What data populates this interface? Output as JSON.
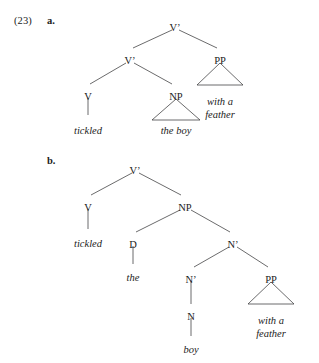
{
  "example": {
    "number": "(23)",
    "sub_a": "a.",
    "sub_b": "b."
  },
  "colors": {
    "stroke": "#39393b",
    "text": "#1b1b1b",
    "background": "#ffffff"
  },
  "trees": [
    {
      "id": "tree-a",
      "label": "a.",
      "sentence": "tickled the boy with a feather",
      "reading": "PP attaches to V-bar (adjunct of the verb phrase)",
      "nodes": [
        {
          "name": "v-bar-root",
          "text": "V’",
          "x": 175,
          "y": 22,
          "italic": false,
          "lines": 1
        },
        {
          "name": "v-bar-lower",
          "text": "V’",
          "x": 130,
          "y": 55,
          "italic": false,
          "lines": 1
        },
        {
          "name": "pp-node",
          "text": "PP",
          "x": 220,
          "y": 55,
          "italic": false,
          "lines": 1
        },
        {
          "name": "v-node",
          "text": "V",
          "x": 88,
          "y": 91,
          "italic": false,
          "lines": 1
        },
        {
          "name": "np-node",
          "text": "NP",
          "x": 176,
          "y": 91,
          "italic": false,
          "lines": 1
        },
        {
          "name": "terminal-tickled",
          "text": "tickled",
          "x": 88,
          "y": 125,
          "italic": true,
          "lines": 1
        },
        {
          "name": "terminal-the-boy",
          "text": "the boy",
          "x": 176,
          "y": 125,
          "italic": true,
          "lines": 1
        },
        {
          "name": "terminal-with-a-feather",
          "text": "with a\nfeather",
          "x": 220,
          "y": 96,
          "italic": true,
          "lines": 2
        }
      ],
      "branches": [
        {
          "name": "branch-root-to-vbar",
          "x1": 172,
          "y1": 30,
          "x2": 133,
          "y2": 48
        },
        {
          "name": "branch-root-to-pp",
          "x1": 179,
          "y1": 30,
          "x2": 217,
          "y2": 48
        },
        {
          "name": "branch-vbar-to-v",
          "x1": 126,
          "y1": 63,
          "x2": 90,
          "y2": 84
        },
        {
          "name": "branch-vbar-to-np",
          "x1": 134,
          "y1": 63,
          "x2": 172,
          "y2": 84
        },
        {
          "name": "branch-v-to-tickled",
          "x1": 88,
          "y1": 98,
          "x2": 88,
          "y2": 115
        }
      ],
      "triangles": [
        {
          "name": "triangle-np-the-boy",
          "apex_x": 176,
          "apex_y": 99,
          "left_x": 152,
          "left_y": 120,
          "right_x": 200,
          "right_y": 120
        },
        {
          "name": "triangle-pp-with-a-feather",
          "apex_x": 220,
          "apex_y": 63,
          "left_x": 197,
          "left_y": 85,
          "right_x": 243,
          "right_y": 85
        }
      ]
    },
    {
      "id": "tree-b",
      "label": "b.",
      "sentence": "tickled the boy with a feather",
      "reading": "PP attaches inside NP to N-bar (modifier of the noun)",
      "nodes": [
        {
          "name": "v-bar-root-b",
          "text": "V’",
          "x": 135,
          "y": 165,
          "italic": false,
          "lines": 1
        },
        {
          "name": "v-node-b",
          "text": "V",
          "x": 88,
          "y": 202,
          "italic": false,
          "lines": 1
        },
        {
          "name": "np-node-b",
          "text": "NP",
          "x": 185,
          "y": 202,
          "italic": false,
          "lines": 1
        },
        {
          "name": "terminal-tickled-b",
          "text": "tickled",
          "x": 88,
          "y": 238,
          "italic": true,
          "lines": 1
        },
        {
          "name": "d-node-b",
          "text": "D",
          "x": 133,
          "y": 239,
          "italic": false,
          "lines": 1
        },
        {
          "name": "n-bar-upper-b",
          "text": "N’",
          "x": 233,
          "y": 239,
          "italic": false,
          "lines": 1
        },
        {
          "name": "terminal-the-b",
          "text": "the",
          "x": 133,
          "y": 272,
          "italic": true,
          "lines": 1
        },
        {
          "name": "n-bar-lower-b",
          "text": "N’",
          "x": 191,
          "y": 274,
          "italic": false,
          "lines": 1
        },
        {
          "name": "pp-node-b",
          "text": "PP",
          "x": 271,
          "y": 274,
          "italic": false,
          "lines": 1
        },
        {
          "name": "n-node-b",
          "text": "N",
          "x": 191,
          "y": 311,
          "italic": false,
          "lines": 1
        },
        {
          "name": "terminal-boy-b",
          "text": "boy",
          "x": 191,
          "y": 344,
          "italic": true,
          "lines": 1
        },
        {
          "name": "terminal-with-a-feather-b",
          "text": "with a\nfeather",
          "x": 271,
          "y": 315,
          "italic": true,
          "lines": 2
        }
      ],
      "branches": [
        {
          "name": "branch-b-root-to-v",
          "x1": 132,
          "y1": 173,
          "x2": 91,
          "y2": 195
        },
        {
          "name": "branch-b-root-to-np",
          "x1": 139,
          "y1": 173,
          "x2": 181,
          "y2": 195
        },
        {
          "name": "branch-b-v-to-tickled",
          "x1": 88,
          "y1": 209,
          "x2": 88,
          "y2": 229
        },
        {
          "name": "branch-b-np-to-d",
          "x1": 180,
          "y1": 210,
          "x2": 136,
          "y2": 232
        },
        {
          "name": "branch-b-np-to-nbar",
          "x1": 191,
          "y1": 210,
          "x2": 230,
          "y2": 232
        },
        {
          "name": "branch-b-d-to-the",
          "x1": 133,
          "y1": 246,
          "x2": 133,
          "y2": 264
        },
        {
          "name": "branch-b-nbar-to-nbar",
          "x1": 229,
          "y1": 247,
          "x2": 194,
          "y2": 267
        },
        {
          "name": "branch-b-nbar-to-pp",
          "x1": 237,
          "y1": 247,
          "x2": 268,
          "y2": 267
        },
        {
          "name": "branch-b-nbar-to-n",
          "x1": 191,
          "y1": 281,
          "x2": 191,
          "y2": 304
        },
        {
          "name": "branch-b-n-to-boy",
          "x1": 191,
          "y1": 318,
          "x2": 191,
          "y2": 336
        }
      ],
      "triangles": [
        {
          "name": "triangle-b-pp-with-a-feather",
          "apex_x": 271,
          "apex_y": 282,
          "left_x": 248,
          "left_y": 304,
          "right_x": 294,
          "right_y": 304
        }
      ]
    }
  ]
}
